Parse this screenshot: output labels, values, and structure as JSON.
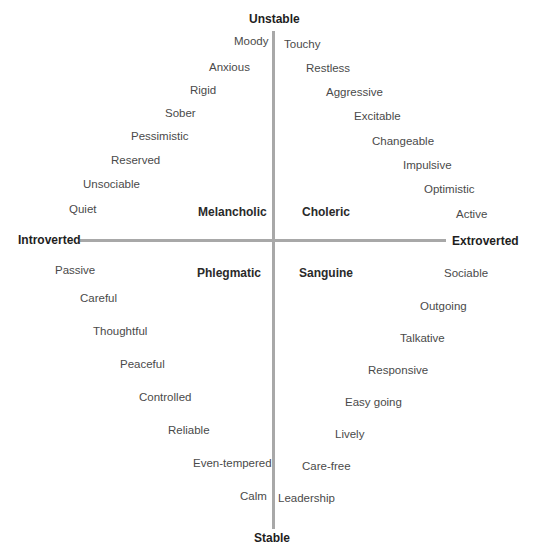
{
  "axes": {
    "top": "Unstable",
    "bottom": "Stable",
    "left": "Introverted",
    "right": "Extroverted"
  },
  "quadrants": {
    "top_left": "Melancholic",
    "top_right": "Choleric",
    "bottom_left": "Phlegmatic",
    "bottom_right": "Sanguine"
  },
  "traits": {
    "melancholic": [
      {
        "label": "Moody",
        "x": 234,
        "y": 6
      },
      {
        "label": "Anxious",
        "x": 209,
        "y": 32
      },
      {
        "label": "Rigid",
        "x": 190,
        "y": 55
      },
      {
        "label": "Sober",
        "x": 165,
        "y": 78
      },
      {
        "label": "Pessimistic",
        "x": 131,
        "y": 101
      },
      {
        "label": "Reserved",
        "x": 111,
        "y": 125
      },
      {
        "label": "Unsociable",
        "x": 83,
        "y": 149
      },
      {
        "label": "Quiet",
        "x": 69,
        "y": 174
      }
    ],
    "choleric": [
      {
        "label": "Touchy",
        "x": 284,
        "y": 9
      },
      {
        "label": "Restless",
        "x": 306,
        "y": 33
      },
      {
        "label": "Aggressive",
        "x": 326,
        "y": 57
      },
      {
        "label": "Excitable",
        "x": 354,
        "y": 81
      },
      {
        "label": "Changeable",
        "x": 372,
        "y": 106
      },
      {
        "label": "Impulsive",
        "x": 403,
        "y": 130
      },
      {
        "label": "Optimistic",
        "x": 424,
        "y": 154
      },
      {
        "label": "Active",
        "x": 456,
        "y": 179
      }
    ],
    "phlegmatic": [
      {
        "label": "Passive",
        "x": 55,
        "y": 235
      },
      {
        "label": "Careful",
        "x": 80,
        "y": 263
      },
      {
        "label": "Thoughtful",
        "x": 93,
        "y": 296
      },
      {
        "label": "Peaceful",
        "x": 120,
        "y": 329
      },
      {
        "label": "Controlled",
        "x": 139,
        "y": 362
      },
      {
        "label": "Reliable",
        "x": 168,
        "y": 395
      },
      {
        "label": "Even-tempered",
        "x": 193,
        "y": 428
      },
      {
        "label": "Calm",
        "x": 240,
        "y": 461
      }
    ],
    "sanguine": [
      {
        "label": "Sociable",
        "x": 444,
        "y": 238
      },
      {
        "label": "Outgoing",
        "x": 420,
        "y": 271
      },
      {
        "label": "Talkative",
        "x": 400,
        "y": 303
      },
      {
        "label": "Responsive",
        "x": 368,
        "y": 335
      },
      {
        "label": "Easy going",
        "x": 345,
        "y": 367
      },
      {
        "label": "Lively",
        "x": 335,
        "y": 399
      },
      {
        "label": "Care-free",
        "x": 302,
        "y": 431
      },
      {
        "label": "Leadership",
        "x": 278,
        "y": 463
      }
    ]
  },
  "colors": {
    "axis_line": "#a8a8a8",
    "trait_text": "#4a4a4a",
    "label_text": "#1e1e1e"
  }
}
